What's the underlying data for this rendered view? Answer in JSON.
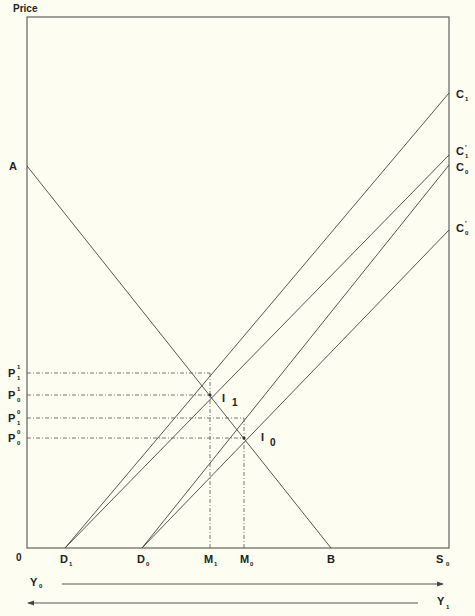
{
  "diagram": {
    "y_axis_label": "Price",
    "origin_label": "0",
    "demand_curve": {
      "start_label": "A",
      "end_label": "B"
    },
    "supply_curves": [
      {
        "label": "C",
        "sub": "1",
        "sup": "",
        "from": "D1"
      },
      {
        "label": "C",
        "sub": "1",
        "sup": "'",
        "from": "D1"
      },
      {
        "label": "C",
        "sub": "0",
        "sup": "",
        "from": "D0"
      },
      {
        "label": "C",
        "sub": "0",
        "sup": "'",
        "from": "D0"
      }
    ],
    "x_axis_labels": [
      {
        "label": "D",
        "sub": "1"
      },
      {
        "label": "D",
        "sub": "0"
      },
      {
        "label": "M",
        "sub": "1"
      },
      {
        "label": "M",
        "sub": "0"
      },
      {
        "label": "B",
        "sub": ""
      },
      {
        "label": "S",
        "sub": "0"
      }
    ],
    "price_levels": [
      {
        "label": "P",
        "sub": "1",
        "sup": "1"
      },
      {
        "label": "P",
        "sub": "0",
        "sup": "1"
      },
      {
        "label": "P",
        "sub": "1",
        "sup": "0"
      },
      {
        "label": "P",
        "sub": "0",
        "sup": "0"
      }
    ],
    "equilibria": [
      {
        "label": "I",
        "sub": "1"
      },
      {
        "label": "I",
        "sub": "0"
      }
    ],
    "income_arrows": [
      {
        "label": "Y",
        "sub": "0",
        "direction": "right"
      },
      {
        "label": "Y",
        "sub": "1",
        "direction": "left"
      }
    ]
  }
}
